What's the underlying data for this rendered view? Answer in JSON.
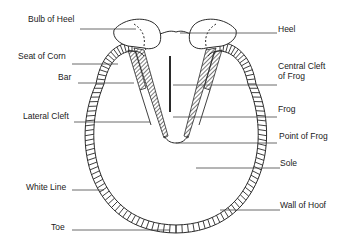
{
  "diagram": {
    "labels_left": [
      {
        "id": "bulb-of-heel",
        "text": "Bulb of Heel"
      },
      {
        "id": "seat-of-corn",
        "text": "Seat of Corn"
      },
      {
        "id": "bar",
        "text": "Bar"
      },
      {
        "id": "lateral-cleft",
        "text": "Lateral Cleft"
      },
      {
        "id": "white-line",
        "text": "White Line"
      },
      {
        "id": "toe",
        "text": "Toe"
      }
    ],
    "labels_right": [
      {
        "id": "heel",
        "text": "Heel"
      },
      {
        "id": "central-cleft-of-frog",
        "text": "Central Cleft",
        "text2": "of Frog"
      },
      {
        "id": "frog",
        "text": "Frog"
      },
      {
        "id": "point-of-frog",
        "text": "Point of Frog"
      },
      {
        "id": "sole",
        "text": "Sole"
      },
      {
        "id": "wall-of-hoof",
        "text": "Wall of Hoof"
      }
    ],
    "colors": {
      "line": "#2a2a2a",
      "background": "#ffffff"
    }
  }
}
